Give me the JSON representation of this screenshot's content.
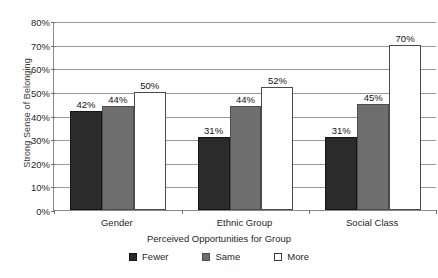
{
  "chart_data": {
    "type": "bar",
    "title": "",
    "xlabel": "Perceived Opportunities for Group",
    "ylabel": "Strong Sense of Belonging",
    "categories": [
      "Gender",
      "Ethnic Group",
      "Social Class"
    ],
    "series": [
      {
        "name": "Fewer",
        "values": [
          42,
          44,
          31
        ],
        "color": "#2b2b2b"
      },
      {
        "name": "Same",
        "values": [
          44,
          44,
          45
        ],
        "color": "#6e6e6e"
      },
      {
        "name": "More",
        "values": [
          50,
          52,
          70
        ],
        "color": "#ffffff"
      }
    ],
    "series_fix": [
      {
        "name": "Fewer",
        "values": [
          42,
          31,
          31
        ]
      },
      {
        "name": "Same",
        "values": [
          44,
          44,
          45
        ]
      },
      {
        "name": "More",
        "values": [
          50,
          52,
          70
        ]
      }
    ],
    "data_labels": [
      [
        "42%",
        "44%",
        "50%"
      ],
      [
        "31%",
        "44%",
        "52%"
      ],
      [
        "31%",
        "45%",
        "70%"
      ]
    ],
    "ylim": [
      0,
      80
    ],
    "ytick_values": [
      0,
      10,
      20,
      30,
      40,
      50,
      60,
      70,
      80
    ],
    "ytick_labels": [
      "0%",
      "10%",
      "20%",
      "30%",
      "40%",
      "50%",
      "60%",
      "70%",
      "80%"
    ],
    "grid": true,
    "legend_position": "bottom",
    "legend_entries": [
      "Fewer",
      "Same",
      "More"
    ],
    "background_color": "#ffffff",
    "gridline_color": "#9a9a9a",
    "axis_color": "#8a8a8a"
  },
  "legend": {
    "items": [
      {
        "label": "Fewer"
      },
      {
        "label": "Same"
      },
      {
        "label": "More"
      }
    ]
  },
  "axes": {
    "y_title": "Strong Sense of Belonging",
    "x_title": "Perceived Opportunities for Group"
  }
}
